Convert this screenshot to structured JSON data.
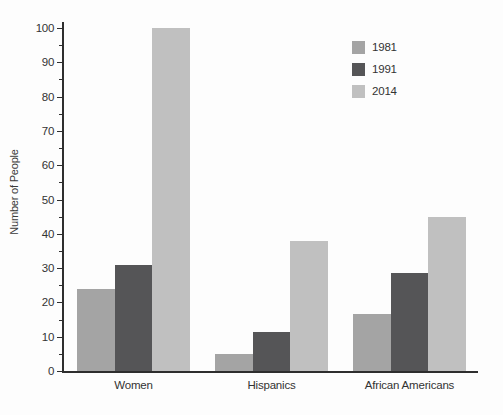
{
  "chart_data": {
    "type": "bar",
    "title": "",
    "categories": [
      "Women",
      "Hispanics",
      "African Americans"
    ],
    "series": [
      {
        "name": "1981",
        "color": "#a4a4a4",
        "values": [
          24,
          5,
          16.5
        ]
      },
      {
        "name": "1991",
        "color": "#555557",
        "values": [
          31,
          11.5,
          28.5
        ]
      },
      {
        "name": "2014",
        "color": "#c0c0c0",
        "values": [
          100,
          38,
          45
        ]
      }
    ],
    "xlabel": "",
    "ylabel": "Number of People",
    "ylim": [
      0,
      100
    ],
    "ytick_step": 10,
    "yminor_step": 5,
    "grid": false,
    "legend_position": "upper-right"
  },
  "colors": {
    "axis": "#2e2e2e",
    "text": "#333333",
    "background": "#fdfdfd"
  }
}
